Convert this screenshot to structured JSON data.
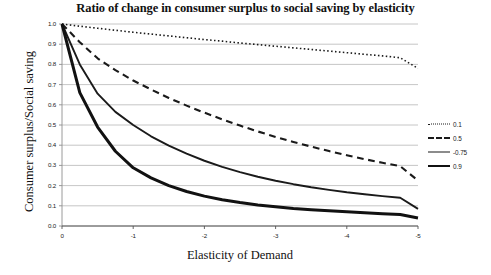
{
  "chart_data": {
    "type": "line",
    "title": "Ratio of change in consumer surplus to social saving by elasticity",
    "xlabel": "Elasticity of Demand",
    "ylabel": "Consumer surplus/Social saving",
    "xlim": [
      0,
      -5
    ],
    "ylim": [
      0,
      1.0
    ],
    "grid": true,
    "legend_position": "right",
    "x": [
      0,
      -0.25,
      -0.5,
      -0.75,
      -1,
      -1.25,
      -1.5,
      -1.75,
      -2,
      -2.25,
      -2.5,
      -2.75,
      -3,
      -3.25,
      -3.5,
      -3.75,
      -4,
      -4.25,
      -4.5,
      -4.75,
      -5
    ],
    "xticks": [
      "0",
      "-1",
      "-2",
      "-3",
      "-4",
      "-5"
    ],
    "xtick_values": [
      0,
      -1,
      -2,
      -3,
      -4,
      -5
    ],
    "yticks": [
      "0.0",
      "0.1",
      "0.2",
      "0.3",
      "0.4",
      "0.5",
      "0.6",
      "0.7",
      "0.8",
      "0.9",
      "1.0"
    ],
    "ytick_values": [
      0.0,
      0.1,
      0.2,
      0.3,
      0.4,
      0.5,
      0.6,
      0.7,
      0.8,
      0.9,
      1.0
    ],
    "series": [
      {
        "name": "0.1",
        "style": "dotted",
        "width": 1.6,
        "color": "#1a1a1a",
        "values": [
          1.0,
          0.989,
          0.979,
          0.969,
          0.959,
          0.95,
          0.941,
          0.932,
          0.923,
          0.915,
          0.906,
          0.898,
          0.89,
          0.882,
          0.874,
          0.866,
          0.858,
          0.85,
          0.842,
          0.833,
          0.78
        ]
      },
      {
        "name": "0.5",
        "style": "dashed",
        "width": 2.1,
        "color": "#1a1a1a",
        "values": [
          1.0,
          0.91,
          0.83,
          0.772,
          0.72,
          0.676,
          0.634,
          0.596,
          0.561,
          0.528,
          0.497,
          0.468,
          0.441,
          0.416,
          0.393,
          0.371,
          0.35,
          0.331,
          0.313,
          0.296,
          0.225
        ]
      },
      {
        "name": "-0.75",
        "style": "solid",
        "width": 1.9,
        "color": "#1a1a1a",
        "values": [
          1.0,
          0.8,
          0.655,
          0.565,
          0.5,
          0.444,
          0.398,
          0.358,
          0.323,
          0.293,
          0.267,
          0.244,
          0.224,
          0.207,
          0.192,
          0.179,
          0.167,
          0.157,
          0.148,
          0.14,
          0.085
        ]
      },
      {
        "name": "0.9",
        "style": "solid",
        "width": 3.0,
        "color": "#111111",
        "values": [
          1.0,
          0.66,
          0.49,
          0.37,
          0.288,
          0.238,
          0.2,
          0.171,
          0.148,
          0.13,
          0.116,
          0.104,
          0.095,
          0.087,
          0.081,
          0.076,
          0.071,
          0.066,
          0.061,
          0.057,
          0.04
        ]
      }
    ]
  },
  "legend": {
    "entries": [
      {
        "label": "0.1"
      },
      {
        "label": "0.5"
      },
      {
        "label": "-0.75"
      },
      {
        "label": "0.9"
      }
    ]
  },
  "colors": {
    "grid": "#b7b7b7",
    "axis": "#8f8f8f",
    "line": "#1a1a1a",
    "background": "#ffffff"
  }
}
